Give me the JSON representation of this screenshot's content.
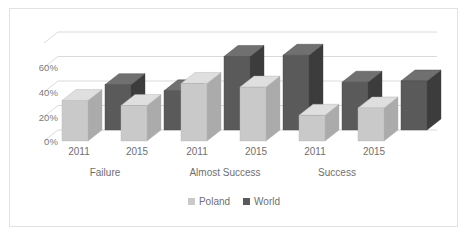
{
  "chart_data": {
    "type": "bar",
    "title": "",
    "subtitle": "",
    "xlabel": "",
    "ylabel": "",
    "style": "3d-clustered-column",
    "grid": true,
    "legend_position": "bottom",
    "ylim": [
      0,
      80
    ],
    "yticks": [
      0,
      20,
      40,
      60
    ],
    "ytick_labels": [
      "0%",
      "20%",
      "40%",
      "60%"
    ],
    "groups": [
      "Failure",
      "Almost Success",
      "Success"
    ],
    "categories": [
      "2011",
      "2015",
      "2011",
      "2015",
      "2011",
      "2015"
    ],
    "series": [
      {
        "name": "Poland",
        "color": "#c9c9c9",
        "values": [
          33,
          29,
          47,
          44,
          21,
          27
        ]
      },
      {
        "name": "World",
        "color": "#5a5a5a",
        "values": [
          37,
          32,
          60,
          61,
          39,
          40
        ]
      }
    ]
  },
  "axis": {
    "y_ticks": [
      {
        "label": "60%"
      },
      {
        "label": "40%"
      },
      {
        "label": "20%"
      },
      {
        "label": "0%"
      }
    ]
  },
  "x_axis": {
    "years": [
      {
        "label": "2011"
      },
      {
        "label": "2015"
      },
      {
        "label": "2011"
      },
      {
        "label": "2015"
      },
      {
        "label": "2011"
      },
      {
        "label": "2015"
      }
    ],
    "groups": [
      {
        "label": "Failure"
      },
      {
        "label": "Almost Success"
      },
      {
        "label": "Success"
      }
    ]
  },
  "legend": {
    "items": [
      {
        "label": "Poland",
        "color": "#c9c9c9"
      },
      {
        "label": "World",
        "color": "#5a5a5a"
      }
    ]
  },
  "colors": {
    "poland_front": "#c9c9c9",
    "poland_top": "#dcdcdc",
    "poland_side": "#a8a8a8",
    "world_front": "#5a5a5a",
    "world_top": "#6e6e6e",
    "world_side": "#434343",
    "gridline": "#d6d6d6",
    "frame": "#e2e2e2",
    "text": "#6f6f6f",
    "background": "#ffffff"
  }
}
